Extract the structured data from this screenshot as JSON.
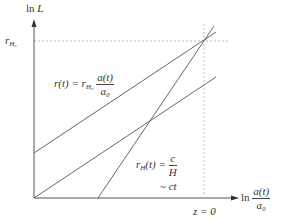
{
  "diagram": {
    "y_axis_label": "ln L",
    "x_axis_label": {
      "prefix": "ln",
      "numerator": "a(t)",
      "denominator": "a₀"
    },
    "y_tick_label": {
      "base": "r",
      "sub": "H₀"
    },
    "x_tick_label": "z = 0",
    "curves": [
      {
        "name": "proper-distance",
        "label": {
          "lhs": "r(t) = r",
          "sub": "H₀",
          "numerator": "a(t)",
          "denominator": "a₀"
        }
      },
      {
        "name": "reference-line",
        "label": ""
      },
      {
        "name": "hubble-radius",
        "label": {
          "lhs": "r",
          "sub": "H",
          "mid": "(t) =",
          "numerator": "c",
          "denominator": "H",
          "approx": "~ ct"
        }
      }
    ],
    "colors": {
      "line": "#555555",
      "dotted": "#aaaaaa",
      "text": "#333333"
    }
  }
}
